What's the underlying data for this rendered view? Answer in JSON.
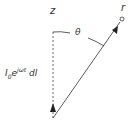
{
  "labels": {
    "z": "z",
    "r": "r",
    "theta": "θ",
    "current_base": "I",
    "current_sub": "0",
    "current_exp_base": "e",
    "current_exp_sup": "jωt",
    "current_dl": " dl"
  },
  "colors": {
    "line": "#333333"
  }
}
